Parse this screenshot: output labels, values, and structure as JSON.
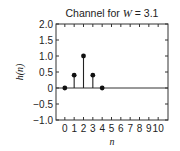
{
  "chart_data": {
    "type": "stem",
    "title": "Channel for W = 3.1",
    "title_parts": {
      "prefix": "Channel for ",
      "var": "W",
      "suffix": " = 3.1"
    },
    "xlabel": "n",
    "ylabel": "h(n)",
    "x": [
      0,
      1,
      2,
      3,
      4
    ],
    "values": [
      0,
      0.4,
      1.0,
      0.4,
      0
    ],
    "xlim": [
      -1,
      11
    ],
    "ylim": [
      -1.0,
      2.0
    ],
    "xticks": [
      0,
      1,
      2,
      3,
      4,
      5,
      6,
      7,
      8,
      9,
      10
    ],
    "xtick_labels": [
      "0",
      "1",
      "2",
      "3",
      "4",
      "5",
      "6",
      "7",
      "8",
      "9",
      "10"
    ],
    "yticks": [
      -1.0,
      -0.5,
      0,
      0.5,
      1.0,
      1.5,
      2.0
    ],
    "ytick_labels": [
      "−1.0",
      "−0.5",
      "0",
      "0.5",
      "1.0",
      "1.5",
      "2.0"
    ],
    "baseline": 0,
    "grid": false,
    "colors": {
      "line": "#222222",
      "marker": "#111111",
      "frame": "#333333"
    }
  }
}
